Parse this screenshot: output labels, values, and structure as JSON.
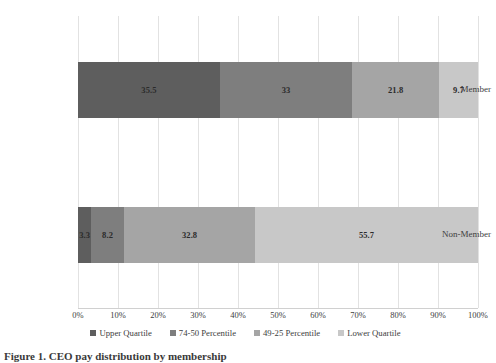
{
  "chart_data": {
    "type": "bar",
    "orientation": "horizontal",
    "stacked": true,
    "normalized_percent": true,
    "title": "",
    "subtitle": "",
    "xlabel": "",
    "ylabel": "",
    "xlim": [
      0,
      100
    ],
    "grid": true,
    "legend_position": "bottom",
    "categories": [
      "Member",
      "Non-Member"
    ],
    "xticks": [
      0,
      10,
      20,
      30,
      40,
      50,
      60,
      70,
      80,
      90,
      100
    ],
    "xtick_labels": [
      "0%",
      "10%",
      "20%",
      "30%",
      "40%",
      "50%",
      "60%",
      "70%",
      "80%",
      "90%",
      "100%"
    ],
    "series": [
      {
        "name": "Upper Quartile",
        "color": "#5e5e5e",
        "values": [
          35.5,
          3.3
        ],
        "labels": [
          "35.5",
          "3.3"
        ]
      },
      {
        "name": "74-50 Percentile",
        "color": "#7e7e7e",
        "values": [
          33,
          8.2
        ],
        "labels": [
          "33",
          "8.2"
        ]
      },
      {
        "name": "49-25 Percentile",
        "color": "#a5a5a5",
        "values": [
          21.8,
          32.8
        ],
        "labels": [
          "21.8",
          "32.8"
        ]
      },
      {
        "name": "Lower Quartile",
        "color": "#c8c8c8",
        "values": [
          9.7,
          55.7
        ],
        "labels": [
          "9.7",
          "55.7"
        ]
      }
    ]
  },
  "caption": {
    "text": "Figure 1. CEO pay distribution by membership"
  }
}
